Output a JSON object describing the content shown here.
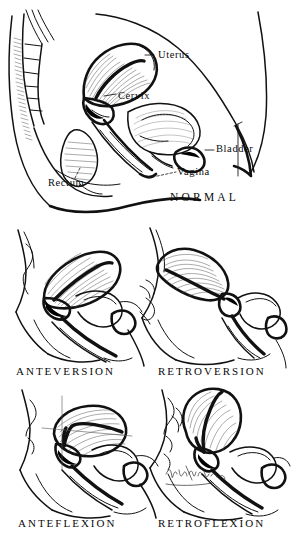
{
  "figure": {
    "background_color": "#ffffff",
    "ink_color": "#111111",
    "artist_signature": "artist-signature-cursive"
  },
  "panels": [
    {
      "id": "normal",
      "caption": "NORMAL",
      "caption_x": 170,
      "caption_y": 196,
      "labels": [
        {
          "id": "uterus",
          "text": "Uterus",
          "x": 158,
          "y": 50
        },
        {
          "id": "cervix",
          "text": "Cervix",
          "x": 118,
          "y": 91
        },
        {
          "id": "bladder",
          "text": "Bladder",
          "x": 216,
          "y": 148
        },
        {
          "id": "vagina",
          "text": "Vagina",
          "x": 177,
          "y": 170
        },
        {
          "id": "rectum",
          "text": "Rectum",
          "x": 48,
          "y": 180
        }
      ]
    },
    {
      "id": "anteversion",
      "caption": "ANTEVERSION",
      "caption_x": 76,
      "caption_y": 370,
      "labels": []
    },
    {
      "id": "retroversion",
      "caption": "RETROVERSION",
      "caption_x": 213,
      "caption_y": 370,
      "labels": []
    },
    {
      "id": "anteflexion",
      "caption": "ANTEFLEXION",
      "caption_x": 76,
      "caption_y": 522,
      "labels": []
    },
    {
      "id": "retroflexion",
      "caption": "RETROFLEXION",
      "caption_x": 213,
      "caption_y": 522,
      "labels": []
    }
  ],
  "anatomy_parts": [
    "uterus",
    "cervix",
    "bladder",
    "vagina",
    "rectum",
    "sacrum",
    "coccyx",
    "pubic-bone",
    "abdominal-wall",
    "perineum"
  ]
}
